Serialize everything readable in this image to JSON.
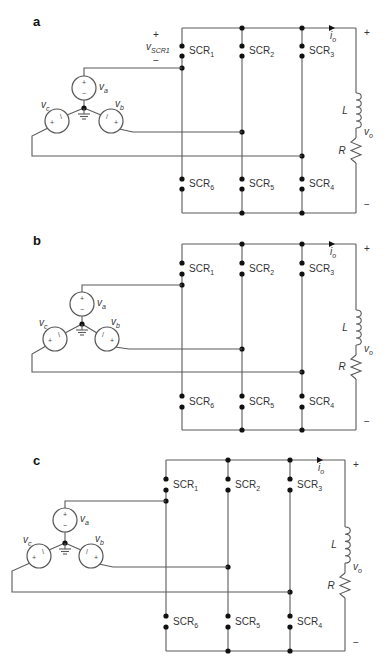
{
  "figure": {
    "colors": {
      "wire": "#5a5a5a",
      "node": "#111111",
      "text": "#333333",
      "background": "#ffffff"
    },
    "panels": [
      {
        "letter": "a",
        "show_vscr1": true,
        "vscr1": {
          "plus": "+",
          "label": "v",
          "sub": "SCR1",
          "minus": "−"
        },
        "sources": {
          "va": {
            "v": "v",
            "sub": "a"
          },
          "vb": {
            "v": "v",
            "sub": "b"
          },
          "vc": {
            "v": "v",
            "sub": "c"
          }
        },
        "scr_top": [
          {
            "text": "SCR",
            "sub": "1"
          },
          {
            "text": "SCR",
            "sub": "2"
          },
          {
            "text": "SCR",
            "sub": "3"
          }
        ],
        "scr_bottom": [
          {
            "text": "SCR",
            "sub": "6"
          },
          {
            "text": "SCR",
            "sub": "5"
          },
          {
            "text": "SCR",
            "sub": "4"
          }
        ],
        "load": {
          "inductor": "L",
          "resistor": "R",
          "vo": "v",
          "vo_sub": "o",
          "io": "i",
          "io_sub": "o",
          "plus": "+",
          "minus": "−"
        }
      },
      {
        "letter": "b",
        "show_vscr1": false,
        "sources": {
          "va": {
            "v": "v",
            "sub": "a"
          },
          "vb": {
            "v": "v",
            "sub": "b"
          },
          "vc": {
            "v": "v",
            "sub": "c"
          }
        },
        "scr_top": [
          {
            "text": "SCR",
            "sub": "1"
          },
          {
            "text": "SCR",
            "sub": "2"
          },
          {
            "text": "SCR",
            "sub": "3"
          }
        ],
        "scr_bottom": [
          {
            "text": "SCR",
            "sub": "6"
          },
          {
            "text": "SCR",
            "sub": "5"
          },
          {
            "text": "SCR",
            "sub": "4"
          }
        ],
        "load": {
          "inductor": "L",
          "resistor": "R",
          "vo": "v",
          "vo_sub": "o",
          "io": "i",
          "io_sub": "o",
          "plus": "+",
          "minus": "−"
        }
      },
      {
        "letter": "c",
        "show_vscr1": false,
        "sources": {
          "va": {
            "v": "v",
            "sub": "a"
          },
          "vb": {
            "v": "v",
            "sub": "b"
          },
          "vc": {
            "v": "v",
            "sub": "c"
          }
        },
        "scr_top": [
          {
            "text": "SCR",
            "sub": "1"
          },
          {
            "text": "SCR",
            "sub": "2"
          },
          {
            "text": "SCR",
            "sub": "3"
          }
        ],
        "scr_bottom": [
          {
            "text": "SCR",
            "sub": "6"
          },
          {
            "text": "SCR",
            "sub": "5"
          },
          {
            "text": "SCR",
            "sub": "4"
          }
        ],
        "load": {
          "inductor": "L",
          "resistor": "R",
          "vo": "v",
          "vo_sub": "o",
          "io": "i",
          "io_sub": "o",
          "plus": "+",
          "minus": "−"
        }
      }
    ]
  }
}
